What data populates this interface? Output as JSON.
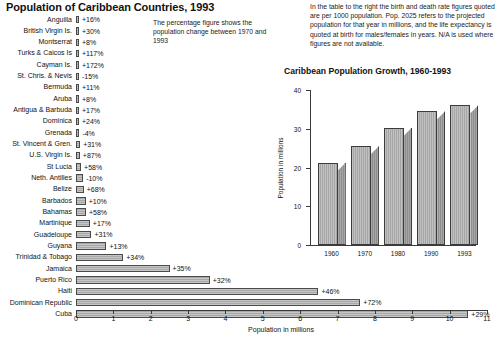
{
  "title": "Population of Caribbean Countries, 1993",
  "notes": {
    "left": "The percentage figure shows the population change between 1970 and 1993",
    "right": "In the table to the right the birth and death rate figures quoted are per 1000 population. Pop. 2025 refers to the projected population for that year in millions, and the life expectancy is quoted at birth for males/females in years. N/A is used where figures are not available."
  },
  "chart_data": [
    {
      "type": "bar",
      "orientation": "horizontal",
      "title": "Population of Caribbean Countries, 1993",
      "xlabel": "Population in millions",
      "ylabel": "",
      "xlim": [
        0,
        11
      ],
      "xticks": [
        0,
        1,
        2,
        3,
        4,
        5,
        6,
        7,
        8,
        9,
        10,
        11
      ],
      "grid": false,
      "categories": [
        "Anguilla",
        "British Virgin Is.",
        "Montserrat",
        "Turks & Caicos Is",
        "Cayman Is.",
        "St. Chris. & Nevis",
        "Bermuda",
        "Aruba",
        "Antigua & Barbuda",
        "Dominica",
        "Grenada",
        "St. Vincent & Gren.",
        "U.S. Virgin Is.",
        "St Lucia",
        "Neth. Antilles",
        "Belize",
        "Barbados",
        "Bahamas",
        "Martinique",
        "Guadeloupe",
        "Guyana",
        "Trinidad & Tobago",
        "Jamaica",
        "Puerto Rico",
        "Haiti",
        "Dominican Republic",
        "Cuba"
      ],
      "values": [
        0.007,
        0.017,
        0.011,
        0.014,
        0.029,
        0.042,
        0.061,
        0.069,
        0.065,
        0.072,
        0.091,
        0.111,
        0.102,
        0.136,
        0.191,
        0.205,
        0.26,
        0.268,
        0.371,
        0.413,
        0.816,
        1.265,
        2.505,
        3.58,
        6.49,
        7.61,
        10.5
      ],
      "annotations": [
        "+16%",
        "+30%",
        "+8%",
        "+117%",
        "+172%",
        "-15%",
        "+11%",
        "+8%",
        "+17%",
        "+24%",
        "-4%",
        "+31%",
        "+87%",
        "+58%",
        "-10%",
        "+68%",
        "+10%",
        "+58%",
        "+17%",
        "+31%",
        "+13%",
        "+34%",
        "+35%",
        "+32%",
        "+46%",
        "+72%",
        "+29%"
      ]
    },
    {
      "type": "bar",
      "orientation": "vertical",
      "title": "Caribbean Population Growth, 1960-1993",
      "xlabel": "",
      "ylabel": "Population in millions",
      "ylim": [
        0,
        40
      ],
      "yticks": [
        0,
        10,
        20,
        30,
        40
      ],
      "grid": false,
      "categories": [
        "1960",
        "1970",
        "1980",
        "1990",
        "1993"
      ],
      "values": [
        21.2,
        25.5,
        30.3,
        34.5,
        36.1
      ]
    }
  ]
}
